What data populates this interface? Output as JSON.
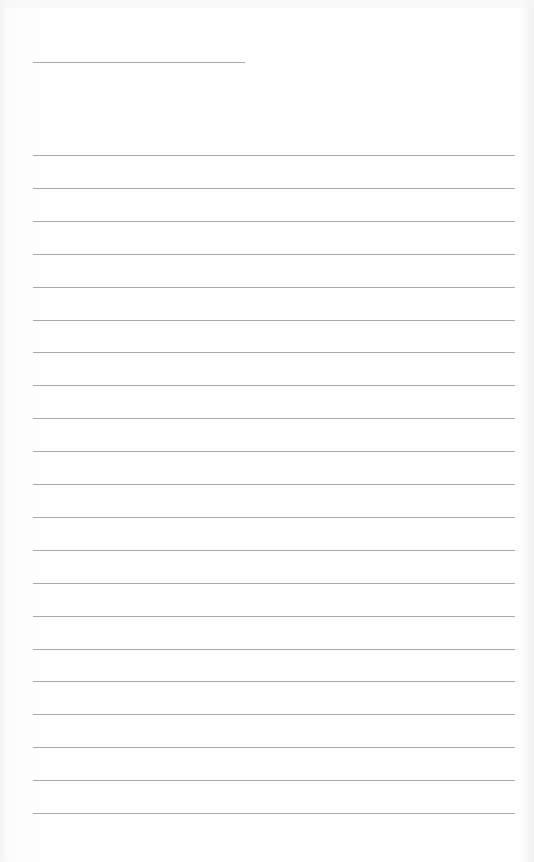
{
  "page": {
    "type": "blank lined paper",
    "header_line": {
      "y": 62,
      "x_start": 33,
      "x_end": 245
    },
    "ruled_lines": {
      "count": 21,
      "first_y": 155,
      "spacing": 32.9,
      "x_start": 33,
      "x_end": 515
    },
    "line_color": "#a9a9a9",
    "background_color": "#fdfdfd",
    "text": ""
  }
}
